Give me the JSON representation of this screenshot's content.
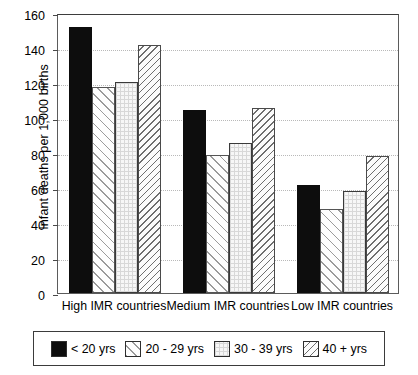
{
  "chart_data": {
    "type": "bar",
    "title": "",
    "subtitle": "",
    "xlabel": "",
    "ylabel": "Infant deaths per 1,000 births",
    "ylim": [
      0,
      160
    ],
    "ytick_step": 20,
    "yticks": [
      "0",
      "20",
      "40",
      "60",
      "80",
      "100",
      "120",
      "140",
      "160"
    ],
    "grid": "horizontal-dotted",
    "legend_position": "bottom-outside-box",
    "categories": [
      "High IMR countries",
      "Medium IMR countries",
      "Low IMR countries"
    ],
    "series": [
      {
        "name": "< 20 yrs",
        "pattern": "solid-black",
        "values": [
          152,
          104.5,
          62
        ]
      },
      {
        "name": "20 - 29 yrs",
        "pattern": "diagonal-hatch-45",
        "values": [
          118,
          79,
          48
        ]
      },
      {
        "name": "30 - 39 yrs",
        "pattern": "fine-dotted-grid",
        "values": [
          120.5,
          85.5,
          58.5
        ]
      },
      {
        "name": "40 + yrs",
        "pattern": "dense-hatch-135",
        "values": [
          142,
          105.5,
          78.5
        ]
      }
    ],
    "colors": {
      "series_0": "#0d0d0d",
      "series_1": "#9a9a9a",
      "series_2": "#d8d8d8",
      "series_3": "#6e6e6e",
      "axis": "#4a4a4a",
      "gridline": "#b9b9b9",
      "background": "#ffffff"
    }
  }
}
